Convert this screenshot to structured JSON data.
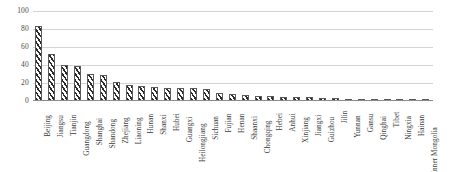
{
  "chart_data": {
    "type": "bar",
    "title": "",
    "subtitle": "",
    "xlabel": "",
    "ylabel": "",
    "ylim": [
      0,
      100
    ],
    "yticks": [
      0,
      20,
      40,
      60,
      80,
      100
    ],
    "grid": true,
    "legend": false,
    "legend_position": "none",
    "orientation": "vertical",
    "bar_style": "diagonal-hatch",
    "series_name": "",
    "categories": [
      "Beijing",
      "Jiangsu",
      "Tianjin",
      "Guangdong",
      "Shanghai",
      "Shandong",
      "Zhejiang",
      "Liaoning",
      "Hunan",
      "Shanxi",
      "Hubei",
      "Guangxi",
      "Heilongjiang",
      "Sichuan",
      "Fujian",
      "Henan",
      "Shaanxi",
      "Chongqing",
      "Hebei",
      "Anhui",
      "Xinjiang",
      "Jiangxi",
      "Guizhou",
      "Jilin",
      "Yunnan",
      "Gansu",
      "Qinghai",
      "Tibet",
      "Ningxia",
      "Hainan",
      "Inner Mongolia"
    ],
    "values": [
      83,
      52,
      40,
      39,
      30,
      29,
      21,
      18,
      17,
      16,
      15,
      14,
      14,
      13,
      9,
      8,
      7,
      6,
      6,
      5,
      5,
      4,
      3,
      3,
      2,
      2,
      2,
      1,
      1,
      1,
      1
    ]
  }
}
